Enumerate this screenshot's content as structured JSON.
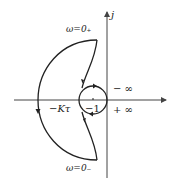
{
  "diagram": {
    "type": "nyquist-plot",
    "axes": {
      "imag_label": "j",
      "real_axis": true
    },
    "labels": {
      "omega_zero_plus": "ω=0₊",
      "omega_zero_minus": "ω=0₋",
      "neg_infinity": "− ∞",
      "pos_infinity": "+ ∞",
      "neg_k_tau": "−Kτ",
      "neg_one": "−1"
    },
    "colors": {
      "curve": "#222222",
      "axis": "#444444"
    }
  }
}
